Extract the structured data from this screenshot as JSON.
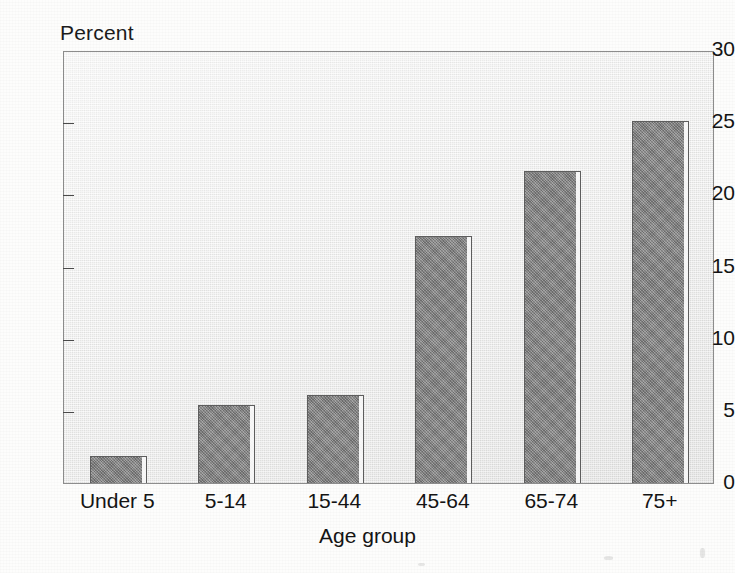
{
  "chart_data": {
    "type": "bar",
    "title": "",
    "xlabel": "Age group",
    "ylabel": "Percent",
    "categories": [
      "Under 5",
      "5-14",
      "15-44",
      "45-64",
      "65-74",
      "75+"
    ],
    "values": [
      1.9,
      5.4,
      6.1,
      17.1,
      21.6,
      25.1
    ],
    "ylim": [
      0,
      30
    ],
    "yticks": [
      0,
      5,
      10,
      15,
      20,
      25,
      30
    ],
    "ytick_labels": [
      "0",
      "5",
      "10",
      "15",
      "20",
      "25",
      "30"
    ],
    "grid": false,
    "legend": null,
    "bar_color": "#8e8e8e",
    "bar_edge_color": "#5d5d5d",
    "plot_background": "#f2f2f1",
    "page_background": "#fdfdfc",
    "text_color": "#141414"
  },
  "axes": {
    "y_axis_title": "Percent",
    "x_axis_title": "Age group"
  }
}
